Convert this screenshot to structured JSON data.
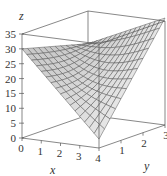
{
  "chart_data": {
    "type": "surface",
    "title": "",
    "xlabel": "x",
    "ylabel": "y",
    "zlabel": "z",
    "xlim": [
      0,
      4
    ],
    "ylim": [
      0,
      3
    ],
    "zlim": [
      0,
      35
    ],
    "x_ticks": [
      "0",
      "1",
      "2",
      "3",
      "4"
    ],
    "y_ticks": [
      "1",
      "2",
      "3"
    ],
    "z_ticks": [
      "0",
      "5",
      "10",
      "15",
      "20",
      "25",
      "30",
      "35"
    ],
    "surface_corners": {
      "x0_y0": 30,
      "x4_y0": 3,
      "x0_y3": 24,
      "x4_y3": 36
    },
    "grid": false,
    "surface_color": "#d9d9d9",
    "edge_color": "#555555"
  }
}
